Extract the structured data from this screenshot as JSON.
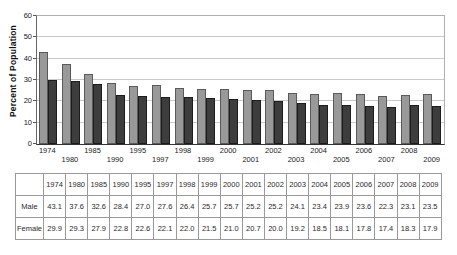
{
  "chart": {
    "ylabel": "Percent of Population",
    "yticks": [
      0,
      10,
      20,
      30,
      40,
      50,
      60
    ],
    "colors": {
      "male_bar": "#999999",
      "female_bar": "#3d3d3d",
      "grid_line": "#c9c9c9"
    }
  },
  "chart_data": {
    "type": "bar",
    "categories": [
      "1974",
      "1980",
      "1985",
      "1990",
      "1995",
      "1997",
      "1998",
      "1999",
      "2000",
      "2001",
      "2002",
      "2003",
      "2004",
      "2005",
      "2006",
      "2007",
      "2008",
      "2009"
    ],
    "series": [
      {
        "name": "Male",
        "values": [
          43.1,
          37.6,
          32.6,
          28.4,
          27.0,
          27.6,
          26.4,
          25.7,
          25.7,
          25.2,
          25.2,
          24.1,
          23.4,
          23.9,
          23.6,
          22.3,
          23.1,
          23.5
        ]
      },
      {
        "name": "Female",
        "values": [
          29.9,
          29.3,
          27.9,
          22.8,
          22.6,
          22.1,
          22.0,
          21.5,
          21.0,
          20.7,
          20.0,
          19.2,
          18.5,
          18.1,
          17.8,
          17.4,
          18.3,
          17.9
        ]
      }
    ],
    "title": "",
    "xlabel": "",
    "ylabel": "Percent of Population",
    "ylim": [
      0,
      60
    ],
    "grid": true,
    "legend": "none",
    "xlabel_layout": "staggered-two-rows"
  },
  "table": {
    "corner_label": "",
    "columns": [
      "1974",
      "1980",
      "1985",
      "1990",
      "1995",
      "1997",
      "1998",
      "1999",
      "2000",
      "2001",
      "2002",
      "2003",
      "2004",
      "2005",
      "2006",
      "2007",
      "2008",
      "2009"
    ],
    "rows": [
      {
        "label": "Male",
        "values": [
          "43.1",
          "37.6",
          "32.6",
          "28.4",
          "27.0",
          "27.6",
          "26.4",
          "25.7",
          "25.7",
          "25.2",
          "25.2",
          "24.1",
          "23.4",
          "23.9",
          "23.6",
          "22.3",
          "23.1",
          "23.5"
        ]
      },
      {
        "label": "Female",
        "values": [
          "29.9",
          "29.3",
          "27.9",
          "22.8",
          "22.6",
          "22.1",
          "22.0",
          "21.5",
          "21.0",
          "20.7",
          "20.0",
          "19.2",
          "18.5",
          "18.1",
          "17.8",
          "17.4",
          "18.3",
          "17.9"
        ]
      }
    ]
  }
}
